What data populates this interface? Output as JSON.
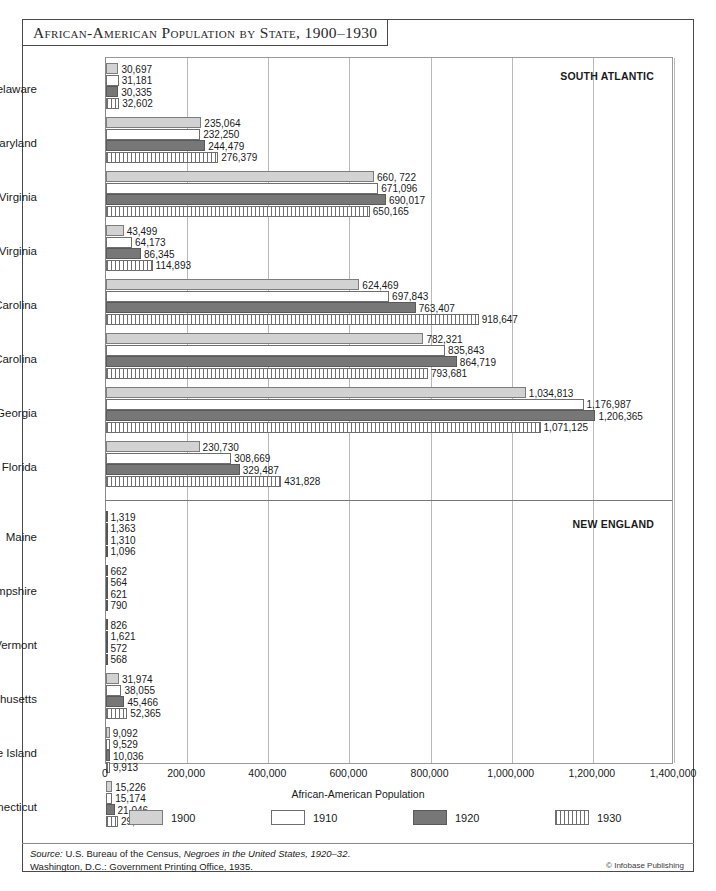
{
  "title": "African-American Population by State, 1900–1930",
  "chart_data": {
    "type": "bar",
    "orientation": "horizontal",
    "title": "African-American Population by State, 1900–1930",
    "xlabel": "African-American Population",
    "ylabel": "",
    "xlim": [
      0,
      1400000
    ],
    "xticks": [
      "0",
      "200,000",
      "400,000",
      "600,000",
      "800,000",
      "1,000,000",
      "1,200,000",
      "1,400,000"
    ],
    "xtick_values": [
      0,
      200000,
      400000,
      600000,
      800000,
      1000000,
      1200000,
      1400000
    ],
    "grid": "vertical",
    "legend_position": "bottom",
    "series": [
      {
        "name": "1900",
        "style": "light-gray-fill"
      },
      {
        "name": "1910",
        "style": "white-fill"
      },
      {
        "name": "1920",
        "style": "dark-gray-fill"
      },
      {
        "name": "1930",
        "style": "vertical-hatch"
      }
    ],
    "regions": [
      {
        "name": "SOUTH ATLANTIC",
        "categories": [
          "Delaware",
          "Maryland",
          "Virginia",
          "West Virginia",
          "North Carolina",
          "South Carolina",
          "Georgia",
          "Florida"
        ],
        "values": {
          "1900": [
            30697,
            235064,
            660722,
            43499,
            624469,
            782321,
            1034813,
            230730
          ],
          "1910": [
            31181,
            232250,
            671096,
            64173,
            697843,
            835843,
            1176987,
            308669
          ],
          "1920": [
            30335,
            244479,
            690017,
            86345,
            763407,
            864719,
            1206365,
            329487
          ],
          "1930": [
            32602,
            276379,
            650165,
            114893,
            918647,
            793681,
            1071125,
            431828
          ]
        },
        "labels": {
          "1900": [
            "30,697",
            "235,064",
            "660, 722",
            "43,499",
            "624,469",
            "782,321",
            "1,034,813",
            "230,730"
          ],
          "1910": [
            "31,181",
            "232,250",
            "671,096",
            "64,173",
            "697,843",
            "835,843",
            "1,176,987",
            "308,669"
          ],
          "1920": [
            "30,335",
            "244,479",
            "690,017",
            "86,345",
            "763,407",
            "864,719",
            "1,206,365",
            "329,487"
          ],
          "1930": [
            "32,602",
            "276,379",
            "650,165",
            "114,893",
            "918,647",
            "793,681",
            "1,071,125",
            "431,828"
          ]
        }
      },
      {
        "name": "NEW ENGLAND",
        "categories": [
          "Maine",
          "New Hampshire",
          "Vermont",
          "Massachusetts",
          "Rhode Island",
          "Connecticut"
        ],
        "values": {
          "1900": [
            1319,
            662,
            826,
            31974,
            9092,
            15226
          ],
          "1910": [
            1363,
            564,
            1621,
            38055,
            9529,
            15174
          ],
          "1920": [
            1310,
            621,
            572,
            45466,
            10036,
            21046
          ],
          "1930": [
            1096,
            790,
            568,
            52365,
            9913,
            29354
          ]
        },
        "labels": {
          "1900": [
            "1,319",
            "662",
            "826",
            "31,974",
            "9,092",
            "15,226"
          ],
          "1910": [
            "1,363",
            "564",
            "1,621",
            "38,055",
            "9,529",
            "15,174"
          ],
          "1920": [
            "1,310",
            "621",
            "572",
            "45,466",
            "10,036",
            "21,046"
          ],
          "1930": [
            "1,096",
            "790",
            "568",
            "52,365",
            "9,913",
            "29,354"
          ]
        }
      }
    ]
  },
  "source": {
    "line1_prefix": "Source:",
    "line1_mid": " U.S. Bureau of the Census, ",
    "line1_italic": "Negroes in the United States, 1920–32",
    "line1_suffix": ".",
    "line2": "Washington, D.C.: Government Printing Office, 1935.",
    "credit": "© Infobase Publishing"
  }
}
